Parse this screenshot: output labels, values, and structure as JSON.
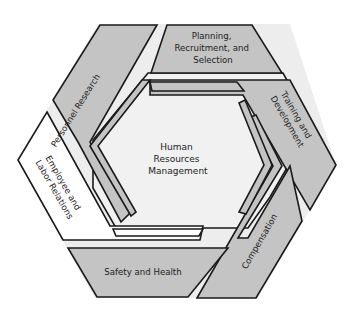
{
  "diagram": {
    "center": {
      "lines": [
        "Human",
        "Resources",
        "Management"
      ]
    },
    "segments": [
      {
        "id": "personnel-research",
        "lines": [
          "Personnel Research"
        ],
        "fill": "#c4c4c4"
      },
      {
        "id": "planning",
        "lines": [
          "Planning,",
          "Recruitment, and",
          "Selection"
        ],
        "fill": "#c4c4c4"
      },
      {
        "id": "training",
        "lines": [
          "Training and",
          "Development"
        ],
        "fill": "#c4c4c4"
      },
      {
        "id": "compensation",
        "lines": [
          "Compensation"
        ],
        "fill": "#c4c4c4"
      },
      {
        "id": "safety",
        "lines": [
          "Safety and Health"
        ],
        "fill": "#c4c4c4"
      },
      {
        "id": "employee-relations",
        "lines": [
          "Employee and",
          "Labor Relations"
        ],
        "fill": "#ffffff"
      }
    ],
    "colors": {
      "segment_gray": "#c4c4c4",
      "gap_light": "#eeeeee",
      "center_fill": "#f1f1f1",
      "outline": "#1a1a1a"
    }
  }
}
